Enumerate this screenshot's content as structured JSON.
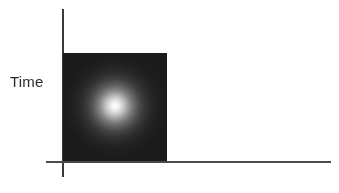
{
  "figure": {
    "background_color": "#ffffff",
    "width": 339,
    "height": 193
  },
  "axes": {
    "y_axis_label": "Time",
    "x_axis_label": "",
    "axis_color": "#3a3a3a",
    "origin_x": 62,
    "origin_y": 161
  },
  "image_panel": {
    "name": "intensity-map",
    "background_color": "#1b1b1b",
    "glow_color": "#ffffff",
    "glow_center_x_pct": 50,
    "glow_center_y_pct": 49,
    "caption": ""
  },
  "chart_data": {
    "type": "heatmap",
    "title": "",
    "subtitle": "",
    "xlabel": "",
    "ylabel": "Time",
    "legend": [],
    "grid": false,
    "annotations": [],
    "xlim": [
      0,
      1
    ],
    "ylim": [
      0,
      1
    ],
    "peak": {
      "x": 0.5,
      "y": 0.49,
      "value": 1.0
    },
    "background_value": 0.05,
    "radial_profile": {
      "radius_fraction": [
        0.0,
        0.04,
        0.08,
        0.13,
        0.19,
        0.25,
        0.31,
        0.38,
        0.45,
        0.53,
        0.62,
        0.72,
        0.84,
        1.0
      ],
      "intensity": [
        1.0,
        0.98,
        0.93,
        0.85,
        0.74,
        0.62,
        0.51,
        0.4,
        0.32,
        0.24,
        0.19,
        0.15,
        0.12,
        0.11
      ]
    }
  }
}
